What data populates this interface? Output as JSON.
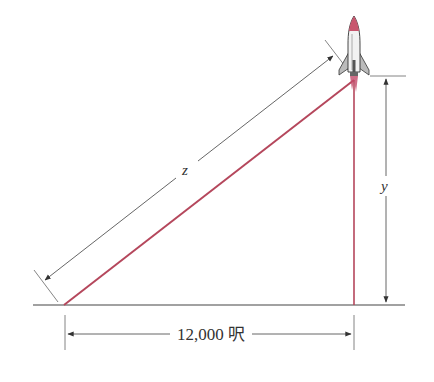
{
  "diagram": {
    "labels": {
      "hypotenuse": "z",
      "height": "y",
      "base": "12,000 呎"
    },
    "colors": {
      "line_of_sight": "#b5475c",
      "rocket_path": "#b5475c",
      "dimension_lines": "#555555",
      "ground": "#444444"
    },
    "icons": {
      "rocket": "rocket-icon"
    }
  }
}
